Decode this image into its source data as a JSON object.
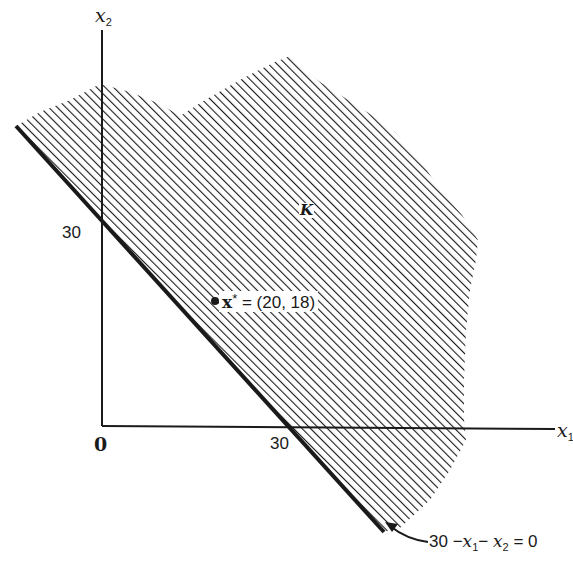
{
  "diagram": {
    "type": "feasible-region-plot",
    "axes": {
      "x_label_var": "x",
      "x_label_sub": "1",
      "y_label_var": "x",
      "y_label_sub": "2",
      "origin_label": "0",
      "x_tick_label": "30",
      "y_tick_label": "30"
    },
    "region": {
      "label": "K",
      "fill": "diagonal hatching"
    },
    "point": {
      "var": "x",
      "star": "*",
      "value_text": " = (20, 18)",
      "x": 20,
      "y": 18
    },
    "constraint": {
      "label_prefix": "30 −",
      "term1_var": "x",
      "term1_sub": "1",
      "minus": "− ",
      "term2_var": "x",
      "term2_sub": "2",
      "suffix": " = 0",
      "equation": "30 - x1 - x2 = 0"
    },
    "colors": {
      "ink": "#1a1a1a",
      "background": "#ffffff"
    }
  }
}
